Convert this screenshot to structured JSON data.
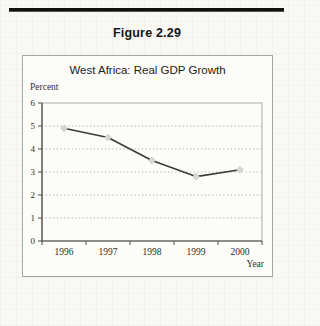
{
  "figure": {
    "caption": "Figure 2.29"
  },
  "chart": {
    "title": "West Africa: Real GDP Growth"
  },
  "chart_data": {
    "type": "line",
    "title": "West Africa: Real GDP Growth",
    "categories": [
      "1996",
      "1997",
      "1998",
      "1999",
      "2000"
    ],
    "values": [
      4.9,
      4.5,
      3.5,
      2.8,
      3.1
    ],
    "series_name": "Real GDP Growth",
    "xlabel": "Year",
    "ylabel": "Percent",
    "ylim": [
      0,
      6
    ],
    "yticks": [
      0,
      1,
      2,
      3,
      4,
      5,
      6
    ],
    "grid": "horizontal-dotted",
    "legend": "none",
    "marker": "diamond",
    "colors": {
      "line": "#3b3b37",
      "marker_fill": "#d8d7cf",
      "marker_edge": "#c4c3ba",
      "grid": "#b3b3aa",
      "axis": "#4a4a44",
      "plot_border": "#adada4",
      "panel_border": "#a6a69e",
      "rule": "#101010",
      "text": "#222220"
    }
  }
}
